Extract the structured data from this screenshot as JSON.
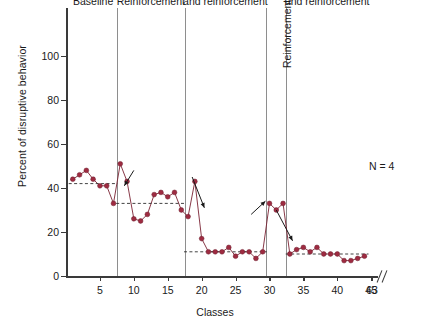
{
  "chart_data": {
    "type": "line",
    "title": "",
    "xlabel": "Classes",
    "ylabel": "Percent of disruptive behavior",
    "annotation": "N = 4",
    "ylim": [
      0,
      110
    ],
    "yticks": [
      0,
      20,
      40,
      60,
      80,
      100
    ],
    "xlim": [
      0,
      46
    ],
    "xticks": [
      5,
      10,
      15,
      20,
      25,
      30,
      35,
      40,
      45,
      63
    ],
    "x_axis_break": true,
    "x_axis_break_after": 45,
    "grid": false,
    "legend": false,
    "marker_color": "#9e2b41",
    "line_color": "#7b2233",
    "phases": [
      {
        "name": "Baseline",
        "label": "Baseline",
        "x_start": 1,
        "x_end": 7,
        "mean": 42,
        "x": [
          1,
          2,
          3,
          4,
          5,
          6,
          7
        ],
        "y": [
          44,
          46,
          48,
          44,
          41,
          41,
          33
        ]
      },
      {
        "name": "Reinforcement",
        "label": "Reinforcement",
        "x_start": 8,
        "x_end": 17,
        "mean": 33,
        "x": [
          8,
          9,
          10,
          11,
          12,
          13,
          14,
          15,
          16,
          17
        ],
        "y": [
          51,
          43,
          26,
          25,
          28,
          37,
          38,
          36,
          38,
          30
        ]
      },
      {
        "name": "Time-out ribbon and reinforcement 1",
        "label": "Time-out ribbon\nand reinforcement",
        "x_start": 18,
        "x_end": 29,
        "mean": 11,
        "x": [
          18,
          19,
          20,
          21,
          22,
          23,
          24,
          25,
          26,
          27,
          28,
          29
        ],
        "y": [
          27,
          43,
          17,
          11,
          11,
          11,
          13,
          9,
          11,
          11,
          8,
          11
        ]
      },
      {
        "name": "Reinforcement 2",
        "label": "Reinforcement",
        "rotated": true,
        "x_start": 30,
        "x_end": 32,
        "mean": null,
        "x": [
          30,
          31,
          32
        ],
        "y": [
          33,
          30,
          33
        ]
      },
      {
        "name": "Time-out ribbon and reinforcement 2",
        "label": "Time-out ribbon\nand reinforcement",
        "x_start": 33,
        "x_end": 44,
        "mean": 10,
        "x": [
          33,
          34,
          35,
          36,
          37,
          38,
          39,
          40,
          41,
          42,
          43,
          44
        ],
        "y": [
          10,
          12,
          13,
          11,
          13,
          10,
          10,
          10,
          7,
          7,
          8,
          9
        ]
      }
    ],
    "annotations_arrows": [
      {
        "name": "arrow-baseline-to-reinforcement",
        "x1": 10.0,
        "y1": 48,
        "x2": 8.6,
        "y2": 41
      },
      {
        "name": "arrow-reinforcement-to-timeout",
        "x1": 18.6,
        "y1": 45,
        "x2": 20.4,
        "y2": 31
      },
      {
        "name": "arrow-to-reinforcement2",
        "x1": 27.3,
        "y1": 28,
        "x2": 29.4,
        "y2": 34
      },
      {
        "name": "arrow-to-timeout2",
        "x1": 31.0,
        "y1": 30,
        "x2": 33.4,
        "y2": 16
      }
    ]
  }
}
